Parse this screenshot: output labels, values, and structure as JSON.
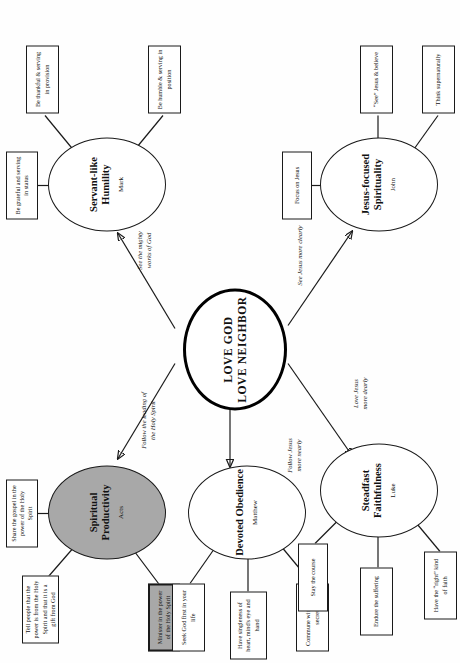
{
  "diagram": {
    "type": "concept-map",
    "orientation": "rotated-90-ccw",
    "hub": {
      "line1": "LOVE GOD",
      "line2": "LOVE NEIGHBOR"
    },
    "branches": [
      {
        "id": "spiritual-productivity",
        "title": "Spiritual Productivity",
        "book": "Acts",
        "shaded": true,
        "edge_label": "Follow the leading of\nthe Holy Spirit",
        "leaves": [
          {
            "text": "Share the gospel in the power of the Holy Spirit",
            "shaded": false
          },
          {
            "text": "Tell people that the power is from the Holy Spirit and that it is a gift from God",
            "shaded": false
          },
          {
            "text": "Minister in the power of the Holy Spirit",
            "shaded": true
          }
        ]
      },
      {
        "id": "servant-like-humility",
        "title": "Servant-like Humility",
        "book": "Mark",
        "shaded": false,
        "edge_label": "See the mighty\nworks of God",
        "leaves": [
          {
            "text": "Be grateful and serving in status",
            "shaded": false
          },
          {
            "text": "Be thankful & serving in provision",
            "shaded": false
          },
          {
            "text": "Be humble & serving in position",
            "shaded": false
          }
        ]
      },
      {
        "id": "devoted-obedience",
        "title": "Devoted Obedience",
        "book": "Matthew",
        "shaded": false,
        "edge_label": "",
        "leaves": [
          {
            "text": "Seek God first in your life",
            "shaded": false
          },
          {
            "text": "Have singleness of heart, mind's eye and hand",
            "shaded": false
          },
          {
            "text": "Commune with God in secret",
            "shaded": false
          }
        ]
      },
      {
        "id": "steadfast-faithfulness",
        "title": "Steadfast Faithfulness",
        "book": "Luke",
        "shaded": false,
        "edge_label": "Follow Jesus\nmore nearly",
        "leaves": [
          {
            "text": "Stay the course",
            "shaded": false
          },
          {
            "text": "Endure the suffering",
            "shaded": false
          },
          {
            "text": "Have the “right” kind of faith",
            "shaded": false
          }
        ]
      },
      {
        "id": "jesus-focused-spirituality",
        "title": "Jesus-focused Spirituality",
        "book": "John",
        "shaded": false,
        "edge_label": "See Jesus more clearly",
        "leaves": [
          {
            "text": "Focus on Jesus",
            "shaded": false
          },
          {
            "text": "“See” Jesus & believe",
            "shaded": false
          },
          {
            "text": "Think supernaturally",
            "shaded": false
          }
        ]
      }
    ],
    "edge_labels": {
      "holy_spirit": "Follow the leading of\nthe Holy Spirit",
      "mighty_works": "See the mighty\nworks of God",
      "see_jesus": "See Jesus more clearly",
      "follow_jesus": "Follow Jesus\nmore nearly",
      "love_jesus": "Love Jesus\nmore dearly"
    },
    "colors": {
      "shaded_fill": "#a8a8a8",
      "stroke": "#1a1a1a",
      "background": "#fefefe"
    }
  }
}
